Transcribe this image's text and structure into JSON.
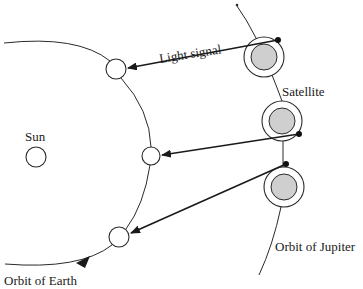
{
  "diagram": {
    "type": "astronomy-schematic",
    "colors": {
      "line": "#2a2a2a",
      "jupiter_fill": "#cfcfcf",
      "background": "#ffffff"
    },
    "labels": {
      "light_signal": "Light signal",
      "satellite": "Satellite",
      "sun": "Sun",
      "orbit_of_jupiter": "Orbit of Jupiter",
      "orbit_of_earth": "Orbit of Earth"
    },
    "sun": {
      "cx": 36,
      "cy": 157,
      "r": 10
    },
    "earth_positions": [
      {
        "cx": 116,
        "cy": 69,
        "r": 10
      },
      {
        "cx": 151,
        "cy": 156,
        "r": 9
      },
      {
        "cx": 119,
        "cy": 237,
        "r": 10
      }
    ],
    "jupiter_positions": [
      {
        "cx": 264,
        "cy": 57,
        "r_outer": 20,
        "r_inner": 13
      },
      {
        "cx": 282,
        "cy": 121,
        "r_outer": 20,
        "r_inner": 13
      },
      {
        "cx": 284,
        "cy": 187,
        "r_outer": 20,
        "r_inner": 13
      }
    ],
    "satellite_positions": [
      {
        "cx": 278,
        "cy": 40
      },
      {
        "cx": 299,
        "cy": 134
      },
      {
        "cx": 286,
        "cy": 164
      }
    ],
    "signals": [
      {
        "from": [
          278,
          40
        ],
        "to": [
          127,
          68
        ]
      },
      {
        "from": [
          299,
          134
        ],
        "to": [
          161,
          155
        ]
      },
      {
        "from": [
          286,
          164
        ],
        "to": [
          130,
          233
        ]
      }
    ]
  }
}
